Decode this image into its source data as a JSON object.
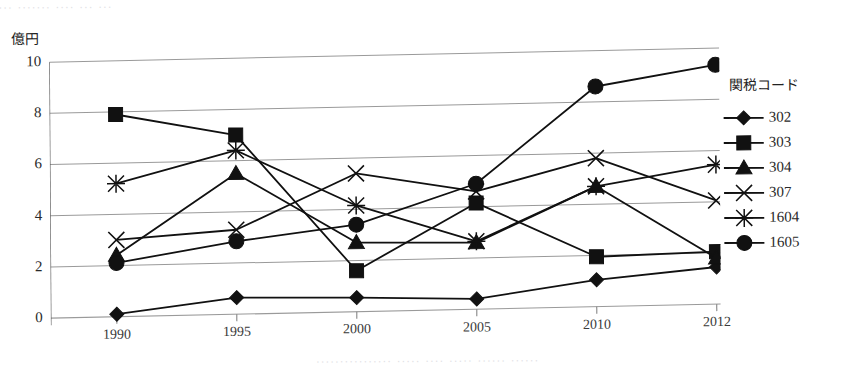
{
  "page": {
    "edge_top_text": "... ....... .... ... ...",
    "edge_bottom_text": "................ ..... .... .....   ...... ......"
  },
  "axis": {
    "y_unit_label": "億円",
    "y_ticks": [
      "0",
      "2",
      "4",
      "6",
      "8",
      "10"
    ],
    "x_ticks": [
      "1990",
      "1995",
      "2000",
      "2005",
      "2010",
      "2012"
    ]
  },
  "legend": {
    "title": "関税コード",
    "items": [
      {
        "label": "302",
        "marker": "diamond-marker-icon"
      },
      {
        "label": "303",
        "marker": "square-marker-icon"
      },
      {
        "label": "304",
        "marker": "triangle-marker-icon"
      },
      {
        "label": "307",
        "marker": "cross-x-marker-icon"
      },
      {
        "label": "1604",
        "marker": "asterisk-marker-icon"
      },
      {
        "label": "1605",
        "marker": "circle-marker-icon"
      }
    ]
  },
  "chart_data": {
    "type": "line",
    "title": "",
    "subtitle": "",
    "xlabel": "",
    "ylabel": "億円",
    "categories": [
      "1990",
      "1995",
      "2000",
      "2005",
      "2010",
      "2012"
    ],
    "ylim": [
      0,
      10
    ],
    "ytick_step": 2,
    "grid": true,
    "legend_position": "right",
    "legend_title": "関税コード",
    "series": [
      {
        "name": "302",
        "marker": "diamond",
        "values": [
          0.1,
          0.65,
          0.55,
          0.4,
          1.05,
          1.45
        ]
      },
      {
        "name": "303",
        "marker": "square",
        "values": [
          7.9,
          7.0,
          1.6,
          4.15,
          1.95,
          2.05
        ]
      },
      {
        "name": "304",
        "marker": "triangle",
        "values": [
          2.4,
          5.5,
          2.7,
          2.6,
          4.7,
          1.8
        ]
      },
      {
        "name": "307",
        "marker": "cross",
        "values": [
          3.0,
          3.3,
          5.4,
          4.6,
          5.8,
          4.05
        ]
      },
      {
        "name": "1604",
        "marker": "asterisk",
        "values": [
          5.2,
          6.4,
          4.15,
          2.65,
          4.7,
          5.45
        ]
      },
      {
        "name": "1605",
        "marker": "circle",
        "values": [
          2.1,
          2.85,
          3.4,
          4.9,
          8.6,
          9.35
        ]
      }
    ]
  }
}
